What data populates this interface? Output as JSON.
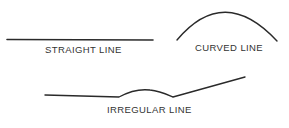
{
  "figure": {
    "line_color": "#2a2a2a",
    "label_color": "#333333",
    "items": [
      {
        "id": "straight",
        "label": "STRAIGHT LINE",
        "shape": "straight-line",
        "path": "M7,39.5 L153,40"
      },
      {
        "id": "curved",
        "label": "CURVED LINE",
        "shape": "arc",
        "path": "M177,40 Q224,-16 277,41"
      },
      {
        "id": "irregular",
        "label": "IRREGULAR LINE",
        "shape": "irregular-line",
        "path": "M45,95 L119,97 C130,91 142,89 150,90 C160,91 166,94 173,97 L245,77"
      }
    ]
  }
}
